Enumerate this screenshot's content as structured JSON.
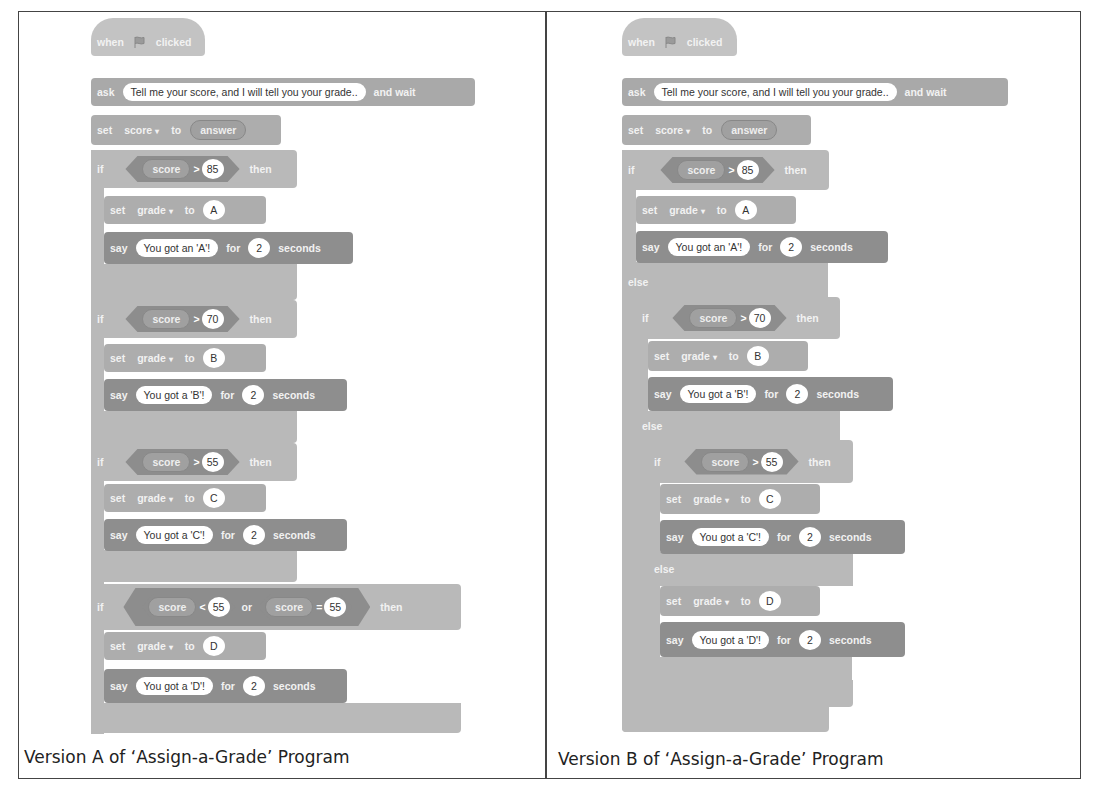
{
  "table": {
    "left_caption": "Version A of ‘Assign-a-Grade’ Program",
    "right_caption": "Version B of ‘Assign-a-Grade’ Program"
  },
  "blocks": {
    "when": "when",
    "clicked": "clicked",
    "ask": "ask",
    "ask_text": "Tell me your score, and I will tell you your grade..",
    "and_wait": "and wait",
    "set": "set",
    "to": "to",
    "score_var": "score",
    "grade_var": "grade",
    "answer": "answer",
    "if": "if",
    "then": "then",
    "else": "else",
    "or": "or",
    "gt": ">",
    "lt": "<",
    "eq": "=",
    "say": "say",
    "for": "for",
    "seconds": "seconds",
    "dropdown_arrow": "▾"
  },
  "version_a": {
    "thresholds": [
      "85",
      "70",
      "55"
    ],
    "last_condition": {
      "lt": "55",
      "eq": "55"
    },
    "grades": [
      "A",
      "B",
      "C",
      "D"
    ],
    "messages": [
      "You got an 'A'!",
      "You got a 'B'!",
      "You got a 'C'!",
      "You got a 'D'!"
    ],
    "duration": "2"
  },
  "version_b": {
    "thresholds": [
      "85",
      "70",
      "55"
    ],
    "grades": [
      "A",
      "B",
      "C",
      "D"
    ],
    "messages": [
      "You got an 'A'!",
      "You got a 'B'!",
      "You got a 'C'!",
      "You got a 'D'!"
    ],
    "duration": "2"
  }
}
